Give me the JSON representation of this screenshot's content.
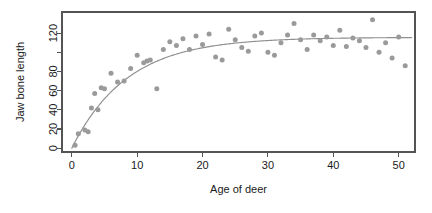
{
  "chart_data": {
    "type": "scatter",
    "title": "",
    "xlabel": "Age of deer",
    "ylabel": "Jaw bone length",
    "xlim": [
      -1.5,
      52.5
    ],
    "ylim": [
      -4,
      142
    ],
    "xticks": [
      0,
      10,
      20,
      30,
      40,
      50
    ],
    "xtick_labels": [
      "0",
      "10",
      "20",
      "30",
      "40",
      "50"
    ],
    "yticks": [
      0,
      20,
      40,
      60,
      80,
      100,
      120
    ],
    "ytick_labels": [
      "0",
      "20",
      "40",
      "60",
      "80",
      "",
      "120"
    ],
    "grid": false,
    "legend": null,
    "point_color": "#9a9a9a",
    "curve_color": "#8f8f8f",
    "frame_color": "#545454",
    "background_color": "#ffffff",
    "x": [
      0.5,
      1.0,
      2.0,
      2.5,
      3.0,
      3.5,
      4.0,
      4.5,
      5.0,
      6.0,
      7.0,
      8.0,
      9.0,
      10.0,
      11.0,
      11.5,
      12.0,
      13.0,
      14.0,
      15.0,
      16.0,
      17.0,
      18.0,
      19.0,
      20.0,
      21.0,
      22.0,
      23.0,
      24.0,
      25.0,
      26.0,
      27.0,
      28.0,
      29.0,
      30.0,
      31.0,
      32.0,
      33.0,
      34.0,
      35.0,
      36.0,
      37.0,
      38.0,
      39.0,
      40.0,
      41.0,
      42.0,
      43.0,
      44.0,
      45.0,
      46.0,
      47.0,
      48.0,
      49.0,
      50.0,
      51.0
    ],
    "y": [
      3.0,
      15.0,
      19.0,
      17.0,
      42.0,
      57.0,
      40.0,
      63.0,
      62.0,
      78.0,
      69.0,
      70.0,
      83.0,
      97.0,
      89.0,
      91.0,
      92.0,
      62.0,
      103.0,
      111.0,
      107.0,
      114.0,
      103.0,
      117.0,
      108.0,
      119.0,
      95.0,
      92.0,
      124.0,
      113.0,
      105.0,
      101.0,
      117.0,
      120.0,
      100.0,
      97.0,
      110.0,
      118.0,
      130.0,
      113.0,
      103.0,
      118.0,
      112.0,
      116.0,
      107.0,
      123.0,
      106.0,
      115.0,
      112.0,
      105.0,
      134.0,
      100.0,
      110.0,
      94.0,
      116.0,
      86.0
    ],
    "fit": {
      "type": "asymptotic-exponential",
      "equation": "y = 115.6 * (1 - exp(-0.118 * x))",
      "asymptote": 115.6,
      "rate": 0.118,
      "description": "Fitted saturating growth curve through the scatter"
    },
    "point_count": 56
  },
  "layout": {
    "plot_left": 62,
    "plot_right": 415,
    "plot_top": 12,
    "plot_bottom": 152
  }
}
